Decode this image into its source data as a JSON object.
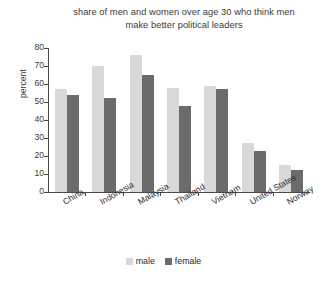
{
  "chart_data": {
    "type": "bar",
    "title": "share of men and women over age 30 who think men make better political leaders",
    "title_line1": "share of men and women over age 30 who think men",
    "title_line2": "make better political leaders",
    "xlabel": "",
    "ylabel": "percent",
    "ylim": [
      0,
      80
    ],
    "yticks": [
      0,
      10,
      20,
      30,
      40,
      50,
      60,
      70,
      80
    ],
    "grid": false,
    "legend_position": "bottom-center",
    "categories": [
      "China",
      "Indonesia",
      "Malaysia",
      "Thailand",
      "Vietnam",
      "United States",
      "Norway"
    ],
    "series": [
      {
        "name": "male",
        "color": "#d9d9d9",
        "values": [
          57,
          70,
          76,
          58,
          59,
          27,
          15
        ]
      },
      {
        "name": "female",
        "color": "#6b6b6b",
        "values": [
          54,
          52,
          65,
          48,
          57,
          23,
          12
        ]
      }
    ]
  },
  "legend": {
    "items": [
      {
        "label": "male"
      },
      {
        "label": "female"
      }
    ]
  }
}
